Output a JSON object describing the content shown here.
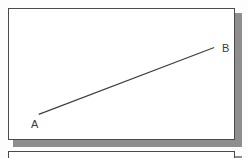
{
  "figure": {
    "title": "",
    "background_color": "#fdfdfd",
    "panel": {
      "fill_color": "#ffffff",
      "border_color": "#4a4a4a",
      "shadow_color": "#8e8e8e"
    },
    "segment": {
      "stroke_color": "#3d3d3d",
      "stroke_width": 1,
      "start_label": "A",
      "end_label": "B",
      "start_point": [
        30,
        107
      ],
      "end_point": [
        207,
        39
      ]
    },
    "labels": {
      "point_a": "A",
      "point_b": "B"
    },
    "panel_below": {
      "fill_color": "#ffffff",
      "border_color": "#4a4a4a"
    }
  }
}
